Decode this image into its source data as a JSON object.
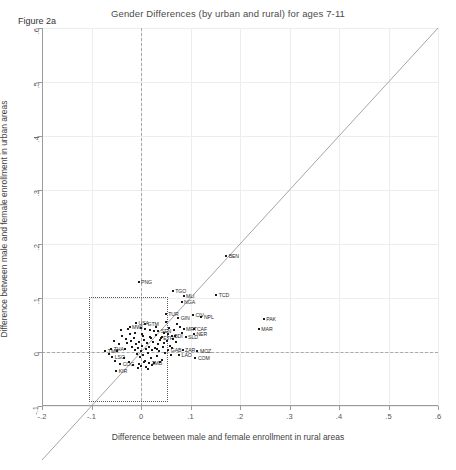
{
  "figure": {
    "title": "Gender Differences (by urban and rural) for ages 7-11",
    "note": "Figure 2a"
  },
  "chart_data": {
    "type": "scatter",
    "title": "Gender Differences (by urban and rural) for ages 7-11",
    "xlabel": "Difference between male and female enrollment in rural areas",
    "ylabel": "Difference between male and female enrollment in urban areas",
    "xlim": [
      -0.2,
      0.6
    ],
    "ylim": [
      -0.1,
      0.6
    ],
    "xticks": [
      "-.2",
      "-.1",
      "0",
      ".1",
      ".2",
      ".3",
      ".4",
      ".5",
      ".6"
    ],
    "xtick_values": [
      -0.2,
      -0.1,
      0,
      0.1,
      0.2,
      0.3,
      0.4,
      0.5,
      0.6
    ],
    "yticks": [
      "-.1",
      "0",
      ".1",
      ".2",
      ".3",
      ".4",
      ".5",
      ".6"
    ],
    "ytick_values": [
      -0.1,
      0,
      0.1,
      0.2,
      0.3,
      0.4,
      0.5,
      0.6
    ],
    "grid": true,
    "legend": "none",
    "annotations": [
      {
        "kind": "reference-line",
        "name": "forty-five-degree-line",
        "from": [
          -0.2,
          -0.2
        ],
        "to": [
          0.6,
          0.6
        ]
      },
      {
        "kind": "zero-line-horizontal",
        "name": "y-zero-dashed",
        "y": 0
      },
      {
        "kind": "zero-line-vertical",
        "name": "x-zero-dashed",
        "x": 0
      },
      {
        "kind": "inset-box",
        "name": "zoom-region-box",
        "x0": -0.105,
        "y0": -0.092,
        "x1": 0.055,
        "y1": 0.102
      }
    ],
    "point_label_field": "code",
    "points": [
      {
        "code": "PNG",
        "x": -0.005,
        "y": 0.13,
        "lp": "right"
      },
      {
        "code": "BEN",
        "x": 0.172,
        "y": 0.178,
        "lp": "right"
      },
      {
        "code": "TGO",
        "x": 0.064,
        "y": 0.113,
        "lp": "right"
      },
      {
        "code": "MLI",
        "x": 0.086,
        "y": 0.104,
        "lp": "right"
      },
      {
        "code": "TCD",
        "x": 0.152,
        "y": 0.106,
        "lp": "right"
      },
      {
        "code": "NGA",
        "x": 0.082,
        "y": 0.093,
        "lp": "right"
      },
      {
        "code": "TUR",
        "x": 0.05,
        "y": 0.07,
        "lp": "right"
      },
      {
        "code": "GIN",
        "x": 0.075,
        "y": 0.063,
        "lp": "right"
      },
      {
        "code": "CIV",
        "x": 0.105,
        "y": 0.068,
        "lp": "right"
      },
      {
        "code": "NPL",
        "x": 0.122,
        "y": 0.064,
        "lp": "right"
      },
      {
        "code": "PAK",
        "x": 0.248,
        "y": 0.061,
        "lp": "right"
      },
      {
        "code": "MAR",
        "x": 0.238,
        "y": 0.043,
        "lp": "right"
      },
      {
        "code": "MRT",
        "x": 0.086,
        "y": 0.043,
        "lp": "right"
      },
      {
        "code": "CAF",
        "x": 0.108,
        "y": 0.043,
        "lp": "right"
      },
      {
        "code": "NER",
        "x": 0.107,
        "y": 0.033,
        "lp": "right"
      },
      {
        "code": "MOZ",
        "x": 0.114,
        "y": 0.002,
        "lp": "right"
      },
      {
        "code": "COM",
        "x": 0.11,
        "y": -0.012,
        "lp": "right"
      },
      {
        "code": "ZAR",
        "x": 0.084,
        "y": 0.004,
        "lp": "right"
      },
      {
        "code": "LAO",
        "x": 0.077,
        "y": -0.006,
        "lp": "right"
      },
      {
        "code": "SLD",
        "x": 0.09,
        "y": 0.028,
        "lp": "right"
      },
      {
        "code": "GAB",
        "x": 0.055,
        "y": 0.004,
        "lp": "right"
      },
      {
        "code": "GTM",
        "x": 0.008,
        "y": 0.051,
        "lp": "right"
      },
      {
        "code": "USA",
        "x": -0.01,
        "y": 0.053,
        "lp": "right"
      },
      {
        "code": "MWI",
        "x": -0.023,
        "y": 0.046,
        "lp": "right"
      },
      {
        "code": "TMP",
        "x": -0.072,
        "y": 0.002,
        "lp": "right"
      },
      {
        "code": "LSO",
        "x": -0.058,
        "y": -0.009,
        "lp": "right"
      },
      {
        "code": "KIR",
        "x": -0.05,
        "y": -0.035,
        "lp": "right"
      },
      {
        "code": "COG",
        "x": -0.042,
        "y": -0.022,
        "lp": "right"
      },
      {
        "code": "ZMB",
        "x": 0.016,
        "y": -0.021,
        "lp": "right"
      },
      {
        "code": "THA",
        "x": -0.06,
        "y": 0.006,
        "lp": "right"
      },
      {
        "code": "BDI",
        "x": 0.062,
        "y": 0.03,
        "lp": "right"
      },
      {
        "code": "ETH",
        "x": 0.04,
        "y": 0.026,
        "lp": "right"
      },
      {
        "code": "SEN",
        "x": 0.035,
        "y": 0.038,
        "lp": "right"
      },
      {
        "code": "",
        "x": -0.038,
        "y": 0.03
      },
      {
        "code": "",
        "x": -0.03,
        "y": 0.024
      },
      {
        "code": "",
        "x": -0.028,
        "y": 0.016
      },
      {
        "code": "",
        "x": -0.02,
        "y": 0.02
      },
      {
        "code": "",
        "x": -0.018,
        "y": 0.01
      },
      {
        "code": "",
        "x": -0.015,
        "y": 0.026
      },
      {
        "code": "",
        "x": -0.013,
        "y": 0.004
      },
      {
        "code": "",
        "x": -0.01,
        "y": 0.014
      },
      {
        "code": "",
        "x": -0.008,
        "y": -0.004
      },
      {
        "code": "",
        "x": -0.006,
        "y": 0.008
      },
      {
        "code": "",
        "x": -0.004,
        "y": 0.018
      },
      {
        "code": "",
        "x": -0.002,
        "y": -0.01
      },
      {
        "code": "",
        "x": 0.0,
        "y": 0.002
      },
      {
        "code": "",
        "x": 0.002,
        "y": 0.012
      },
      {
        "code": "",
        "x": 0.004,
        "y": -0.006
      },
      {
        "code": "",
        "x": 0.006,
        "y": 0.022
      },
      {
        "code": "",
        "x": 0.008,
        "y": -0.016
      },
      {
        "code": "",
        "x": 0.01,
        "y": 0.006
      },
      {
        "code": "",
        "x": 0.012,
        "y": 0.016
      },
      {
        "code": "",
        "x": 0.014,
        "y": -0.002
      },
      {
        "code": "",
        "x": 0.016,
        "y": 0.01
      },
      {
        "code": "",
        "x": 0.018,
        "y": 0.028
      },
      {
        "code": "",
        "x": 0.02,
        "y": -0.012
      },
      {
        "code": "",
        "x": 0.022,
        "y": 0.004
      },
      {
        "code": "",
        "x": 0.024,
        "y": 0.018
      },
      {
        "code": "",
        "x": 0.026,
        "y": -0.02
      },
      {
        "code": "",
        "x": 0.028,
        "y": 0.008
      },
      {
        "code": "",
        "x": 0.03,
        "y": 0.032
      },
      {
        "code": "",
        "x": 0.032,
        "y": -0.008
      },
      {
        "code": "",
        "x": 0.034,
        "y": 0.014
      },
      {
        "code": "",
        "x": 0.036,
        "y": 0.002
      },
      {
        "code": "",
        "x": 0.038,
        "y": 0.022
      },
      {
        "code": "",
        "x": 0.042,
        "y": -0.014
      },
      {
        "code": "",
        "x": 0.044,
        "y": 0.01
      },
      {
        "code": "",
        "x": 0.046,
        "y": 0.036
      },
      {
        "code": "",
        "x": 0.048,
        "y": -0.002
      },
      {
        "code": "",
        "x": 0.052,
        "y": 0.02
      },
      {
        "code": "",
        "x": 0.056,
        "y": 0.044
      },
      {
        "code": "",
        "x": 0.058,
        "y": 0.012
      },
      {
        "code": "",
        "x": 0.06,
        "y": -0.006
      },
      {
        "code": "",
        "x": 0.066,
        "y": 0.04
      },
      {
        "code": "",
        "x": 0.07,
        "y": 0.018
      },
      {
        "code": "",
        "x": 0.072,
        "y": 0.052
      },
      {
        "code": "",
        "x": -0.045,
        "y": 0.014
      },
      {
        "code": "",
        "x": -0.048,
        "y": 0.002
      },
      {
        "code": "",
        "x": -0.035,
        "y": -0.012
      },
      {
        "code": "",
        "x": -0.032,
        "y": 0.006
      },
      {
        "code": "",
        "x": -0.025,
        "y": -0.018
      },
      {
        "code": "",
        "x": -0.022,
        "y": 0.034
      },
      {
        "code": "",
        "x": -0.016,
        "y": -0.024
      },
      {
        "code": "",
        "x": -0.012,
        "y": 0.036
      },
      {
        "code": "",
        "x": -0.005,
        "y": -0.022
      },
      {
        "code": "",
        "x": 0.001,
        "y": -0.026
      },
      {
        "code": "",
        "x": 0.005,
        "y": 0.03
      },
      {
        "code": "",
        "x": 0.011,
        "y": -0.028
      },
      {
        "code": "",
        "x": 0.019,
        "y": 0.04
      },
      {
        "code": "",
        "x": 0.023,
        "y": -0.024
      },
      {
        "code": "",
        "x": 0.031,
        "y": 0.046
      },
      {
        "code": "",
        "x": 0.039,
        "y": -0.018
      },
      {
        "code": "",
        "x": 0.05,
        "y": 0.056
      },
      {
        "code": "",
        "x": 0.062,
        "y": 0.008
      },
      {
        "code": "",
        "x": 0.068,
        "y": 0.03
      },
      {
        "code": "",
        "x": -0.055,
        "y": 0.02
      },
      {
        "code": "",
        "x": -0.065,
        "y": -0.004
      },
      {
        "code": "",
        "x": -0.04,
        "y": 0.04
      },
      {
        "code": "",
        "x": -0.052,
        "y": -0.016
      },
      {
        "code": "",
        "x": 0.009,
        "y": 0.042
      },
      {
        "code": "",
        "x": 0.027,
        "y": 0.038
      },
      {
        "code": "",
        "x": 0.043,
        "y": 0.028
      },
      {
        "code": "",
        "x": 0.054,
        "y": 0.034
      },
      {
        "code": "",
        "x": 0.078,
        "y": 0.046
      },
      {
        "code": "",
        "x": 0.082,
        "y": 0.036
      },
      {
        "code": "",
        "x": 0.003,
        "y": 0.034
      },
      {
        "code": "",
        "x": -0.001,
        "y": 0.044
      },
      {
        "code": "",
        "x": 0.015,
        "y": -0.032
      },
      {
        "code": "",
        "x": -0.006,
        "y": -0.03
      },
      {
        "code": "",
        "x": 0.033,
        "y": 0.006
      },
      {
        "code": "",
        "x": 0.021,
        "y": 0.026
      },
      {
        "code": "",
        "x": 0.007,
        "y": -0.018
      },
      {
        "code": "",
        "x": -0.026,
        "y": 0.042
      },
      {
        "code": "",
        "x": 0.064,
        "y": 0.024
      },
      {
        "code": "",
        "x": 0.047,
        "y": 0.016
      }
    ]
  }
}
